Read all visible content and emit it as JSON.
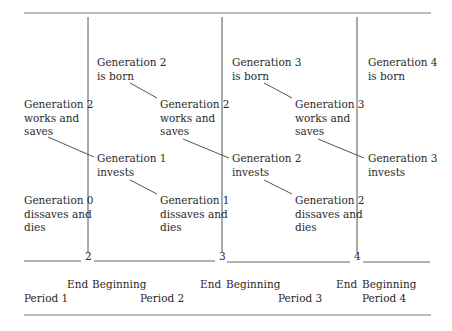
{
  "diagram": {
    "labels": [
      {
        "id": "gen2-born",
        "text": "Generation 2\nis born",
        "x": 97,
        "y": 56
      },
      {
        "id": "gen3-born",
        "text": "Generation 3\nis born",
        "x": 232,
        "y": 56
      },
      {
        "id": "gen4-born",
        "text": "Generation 4\nis born",
        "x": 368,
        "y": 56
      },
      {
        "id": "gen2-works-p1",
        "text": "Generation 2\nworks and\nsaves",
        "x": 24,
        "y": 98
      },
      {
        "id": "gen2-works-p2",
        "text": "Generation 2\nworks and\nsaves",
        "x": 160,
        "y": 98
      },
      {
        "id": "gen3-works-p3",
        "text": "Generation 3\nworks and\nsaves",
        "x": 295,
        "y": 98
      },
      {
        "id": "gen1-invests",
        "text": "Generation 1\ninvests",
        "x": 97,
        "y": 152
      },
      {
        "id": "gen2-invests",
        "text": "Generation 2\ninvests",
        "x": 232,
        "y": 152
      },
      {
        "id": "gen3-invests",
        "text": "Generation 3\ninvests",
        "x": 368,
        "y": 152
      },
      {
        "id": "gen0-dies",
        "text": "Generation 0\ndissaves and\ndies",
        "x": 24,
        "y": 194
      },
      {
        "id": "gen1-dies",
        "text": "Generation 1\ndissaves and\ndies",
        "x": 160,
        "y": 194
      },
      {
        "id": "gen2-dies",
        "text": "Generation 2\ndissaves and\ndies",
        "x": 295,
        "y": 194
      }
    ],
    "boundaries": [
      {
        "number": "2",
        "x": 88
      },
      {
        "number": "3",
        "x": 222
      },
      {
        "number": "4",
        "x": 357
      }
    ],
    "axis_labels": [
      {
        "text": "End",
        "x": 67,
        "y": 278
      },
      {
        "text": "Beginning",
        "x": 92,
        "y": 278
      },
      {
        "text": "End",
        "x": 200,
        "y": 278
      },
      {
        "text": "Beginning",
        "x": 226,
        "y": 278
      },
      {
        "text": "End",
        "x": 336,
        "y": 278
      },
      {
        "text": "Beginning",
        "x": 362,
        "y": 278
      },
      {
        "text": "Period 1",
        "x": 24,
        "y": 292
      },
      {
        "text": "Period 2",
        "x": 140,
        "y": 292
      },
      {
        "text": "Period 3",
        "x": 278,
        "y": 292
      },
      {
        "text": "Period 4",
        "x": 362,
        "y": 292
      }
    ],
    "line_color": "#555555"
  }
}
